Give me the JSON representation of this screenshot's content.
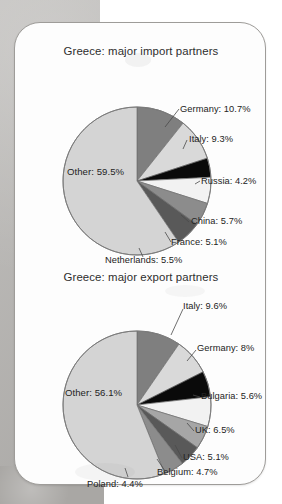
{
  "page": {
    "background_color": "#b5b3b0",
    "card_background": "#fdfdfd",
    "card_border_color": "#9e9c99"
  },
  "chart_data": [
    {
      "type": "pie",
      "title": "Greece: major import partners",
      "categories": [
        "Germany",
        "Italy",
        "Russia",
        "China",
        "France",
        "Netherlands",
        "Other"
      ],
      "values": [
        10.7,
        9.3,
        4.2,
        5.7,
        5.1,
        5.5,
        59.5
      ],
      "labels": [
        "Germany: 10.7%",
        "Italy: 9.3%",
        "Russia: 4.2%",
        "China: 5.7%",
        "France: 5.1%",
        "Netherlands: 5.5%",
        "Other: 59.5%"
      ],
      "colors": [
        "#7f7f7f",
        "#d9d9d9",
        "#0a0a0a",
        "#f2f2f2",
        "#8c8c8c",
        "#595959",
        "#d4d4d4"
      ],
      "xlabel": "",
      "ylabel": "",
      "legend": "callout-labels",
      "grid": false
    },
    {
      "type": "pie",
      "title": "Greece: major export partners",
      "categories": [
        "Italy",
        "Germany",
        "Bulgaria",
        "UK",
        "USA",
        "Belgium",
        "Poland",
        "Other"
      ],
      "values": [
        9.6,
        8.0,
        5.6,
        6.5,
        5.1,
        4.7,
        4.4,
        56.1
      ],
      "labels": [
        "Italy: 9.6%",
        "Germany: 8%",
        "Bulgaria: 5.6%",
        "UK: 6.5%",
        "USA: 5.1%",
        "Belgium: 4.7%",
        "Poland: 4.4%",
        "Other: 56.1%"
      ],
      "colors": [
        "#7f7f7f",
        "#d9d9d9",
        "#0a0a0a",
        "#f2f2f2",
        "#a6a6a6",
        "#595959",
        "#8c8c8c",
        "#d4d4d4"
      ],
      "xlabel": "",
      "ylabel": "",
      "legend": "callout-labels",
      "grid": false
    }
  ],
  "charts": {
    "import": {
      "title": "Greece: major import partners",
      "center": {
        "x": 122,
        "y": 152,
        "r": 74
      },
      "slices": [
        {
          "name": "Germany",
          "value": 10.7,
          "label": "Germany: 10.7%",
          "color": "#7f7f7f"
        },
        {
          "name": "Italy",
          "value": 9.3,
          "label": "Italy: 9.3%",
          "color": "#d9d9d9"
        },
        {
          "name": "Russia",
          "value": 4.2,
          "label": "Russia: 4.2%",
          "color": "#0a0a0a"
        },
        {
          "name": "China",
          "value": 5.7,
          "label": "China: 5.7%",
          "color": "#f2f2f2"
        },
        {
          "name": "France",
          "value": 5.1,
          "label": "France: 5.1%",
          "color": "#8c8c8c"
        },
        {
          "name": "Netherlands",
          "value": 5.5,
          "label": "Netherlands: 5.5%",
          "color": "#595959"
        },
        {
          "name": "Other",
          "value": 59.5,
          "label": "Other: 59.5%",
          "color": "#d4d4d4"
        }
      ]
    },
    "export": {
      "title": "Greece: major export partners",
      "center": {
        "x": 122,
        "y": 142,
        "r": 74
      },
      "slices": [
        {
          "name": "Italy",
          "value": 9.6,
          "label": "Italy: 9.6%",
          "color": "#7f7f7f"
        },
        {
          "name": "Germany",
          "value": 8.0,
          "label": "Germany: 8%",
          "color": "#d9d9d9"
        },
        {
          "name": "Bulgaria",
          "value": 5.6,
          "label": "Bulgaria: 5.6%",
          "color": "#0a0a0a"
        },
        {
          "name": "UK",
          "value": 6.5,
          "label": "UK: 6.5%",
          "color": "#f2f2f2"
        },
        {
          "name": "USA",
          "value": 5.1,
          "label": "USA: 5.1%",
          "color": "#a6a6a6"
        },
        {
          "name": "Belgium",
          "value": 4.7,
          "label": "Belgium: 4.7%",
          "color": "#595959"
        },
        {
          "name": "Poland",
          "value": 4.4,
          "label": "Poland: 4.4%",
          "color": "#8c8c8c"
        },
        {
          "name": "Other",
          "value": 56.1,
          "label": "Other: 56.1%",
          "color": "#d4d4d4"
        }
      ]
    }
  }
}
